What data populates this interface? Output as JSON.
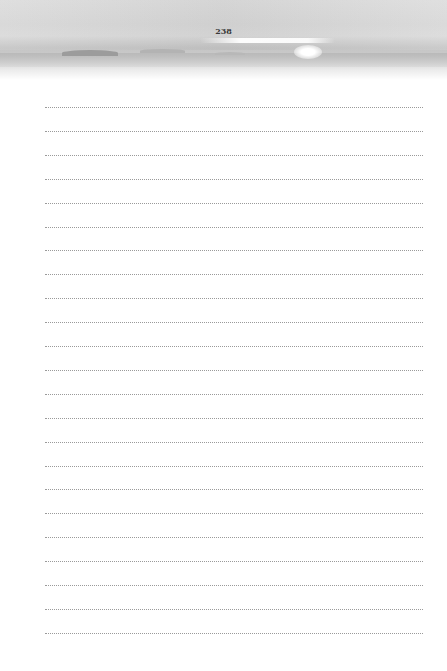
{
  "page": {
    "number": "238",
    "header_image": {
      "description": "grayscale seascape with horizon, distant islands and sun glow",
      "tone": "#d2d2d2"
    },
    "writing_lines": {
      "count": 23,
      "style": "dotted",
      "color": "#9a9a9a",
      "first_y": 107,
      "spacing": 23.9,
      "left": 45,
      "right": 423
    }
  }
}
